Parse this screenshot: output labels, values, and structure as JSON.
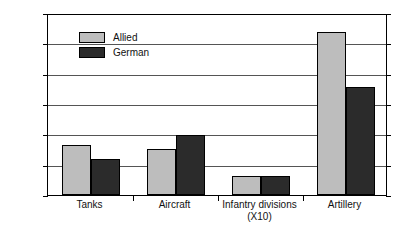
{
  "chart_data": {
    "type": "bar",
    "title": "",
    "subtitle": "",
    "xlabel": "",
    "ylabel": "",
    "categories": [
      "Tanks",
      "Aircraft",
      "Infantry divisions\n(X10)",
      "Artillery"
    ],
    "series": [
      {
        "name": "Allied",
        "color": "#bdbdbd",
        "values": [
          3300,
          3050,
          1250,
          10750
        ]
      },
      {
        "name": "German",
        "color": "#2b2b2b",
        "values": [
          2350,
          3950,
          1250,
          7100
        ]
      }
    ],
    "ylim": [
      0,
      12000
    ],
    "ytick_values": [
      0,
      2000,
      4000,
      6000,
      8000,
      10000,
      12000
    ],
    "ytick_labels": [
      "0",
      "2,000",
      "4,000",
      "6,000",
      "8,000",
      "10,000",
      "12,000"
    ],
    "grid": true,
    "legend_position": "upper-left-inside",
    "annotations": []
  },
  "legend": {
    "items": [
      {
        "label": "Allied",
        "swatch": "allied-swatch"
      },
      {
        "label": "German",
        "swatch": "german-swatch"
      }
    ]
  },
  "colors": {
    "allied": "#bdbdbd",
    "german": "#2b2b2b",
    "axis": "#000000",
    "grid": "#555555",
    "background": "#ffffff",
    "text": "#111111"
  }
}
